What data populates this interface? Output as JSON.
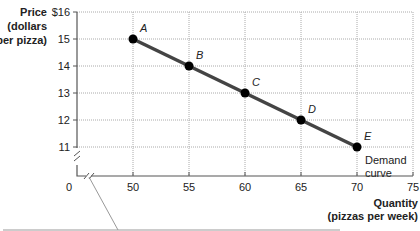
{
  "chart_data": {
    "type": "line",
    "title": "",
    "xlabel": "Quantity (pizzas per week)",
    "ylabel": "Price (dollars per pizza)",
    "xlabel_lines": [
      "Quantity",
      "(pizzas per week)"
    ],
    "ylabel_lines": [
      "Price",
      "(dollars",
      "per pizza)"
    ],
    "x_ticks": [
      "0",
      "50",
      "55",
      "60",
      "65",
      "70",
      "75"
    ],
    "y_ticks": [
      "$16",
      "15",
      "14",
      "13",
      "12",
      "11"
    ],
    "xlim": [
      45,
      75
    ],
    "ylim": [
      10,
      16
    ],
    "grid": true,
    "axis_breaks": [
      "x",
      "y"
    ],
    "series": [
      {
        "name": "Demand curve",
        "points": [
          {
            "label": "A",
            "x": 50,
            "y": 15
          },
          {
            "label": "B",
            "x": 55,
            "y": 14
          },
          {
            "label": "C",
            "x": 60,
            "y": 13
          },
          {
            "label": "D",
            "x": 65,
            "y": 12
          },
          {
            "label": "E",
            "x": 70,
            "y": 11
          }
        ]
      }
    ],
    "annotations": [
      {
        "text_lines": [
          "Demand",
          "curve"
        ],
        "near": "E"
      }
    ]
  }
}
